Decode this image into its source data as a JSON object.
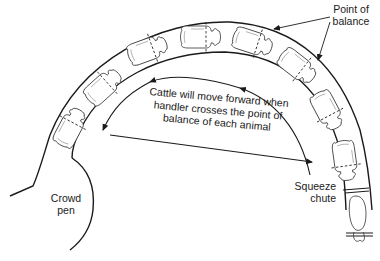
{
  "diagram": {
    "labels": {
      "point_of_balance_line1": "Point of",
      "point_of_balance_line2": "balance",
      "center_line1": "Cattle will move forward when",
      "center_line2": "handler crosses the point of",
      "center_line3": "balance of each animal",
      "crowd_pen_line1": "Crowd",
      "crowd_pen_line2": "pen",
      "squeeze_chute_line1": "Squeeze",
      "squeeze_chute_line2": "chute"
    },
    "elements": {
      "animals_in_chute": 8,
      "point_of_balance_markers": "dashed lines across each animal at shoulder",
      "handler_path_arrows": [
        "arc arrow moving backward (toward crowd pen)",
        "straight arrow returning toward squeeze chute"
      ]
    },
    "colors": {
      "line": "#1a1a1a",
      "background": "#ffffff"
    }
  }
}
